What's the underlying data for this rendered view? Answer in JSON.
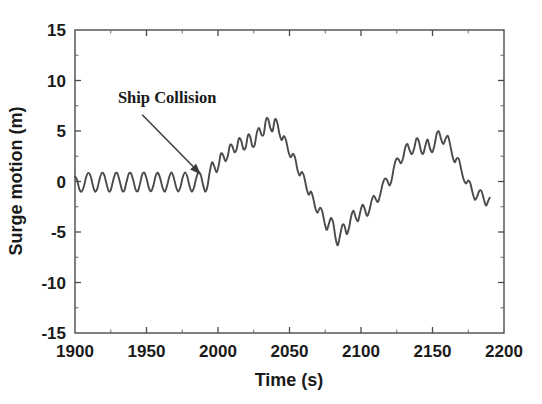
{
  "chart_data": {
    "type": "line",
    "title": "",
    "xlabel": "Time (s)",
    "ylabel": "Surge motion (m)",
    "xlim": [
      1900,
      2200
    ],
    "ylim": [
      -15,
      15
    ],
    "xticks": [
      1900,
      1950,
      2000,
      2050,
      2100,
      2150,
      2200
    ],
    "xtick_labels": [
      "1900",
      "1950",
      "2000",
      "2050",
      "2100",
      "2150",
      "2200"
    ],
    "yticks": [
      -15,
      -10,
      -5,
      0,
      5,
      10,
      15
    ],
    "ytick_labels": [
      "-15",
      "-10",
      "-5",
      "0",
      "5",
      "10",
      "15"
    ],
    "xminor_step": 25,
    "yminor_step": 2.5,
    "grid": false,
    "legend": null,
    "line_color": "#4b4b4b",
    "annotations": [
      {
        "text": "Ship Collision",
        "text_x": 1930,
        "text_y": 7.8,
        "arrow_from_x": 1947,
        "arrow_from_y": 6.6,
        "arrow_to_x": 1988,
        "arrow_to_y": 0.7
      }
    ],
    "series": [
      {
        "name": "Surge motion",
        "x": [
          1900,
          1901.5,
          1903,
          1904.6,
          1906.2,
          1907.8,
          1909.4,
          1911,
          1912.5,
          1914,
          1915.6,
          1917.2,
          1918.8,
          1920.4,
          1922,
          1923.5,
          1925,
          1926.6,
          1928.2,
          1929.8,
          1931.4,
          1933,
          1934.5,
          1936,
          1937.6,
          1939.2,
          1940.8,
          1942.4,
          1944,
          1945.5,
          1947,
          1948.6,
          1950.2,
          1951.8,
          1953.4,
          1955,
          1956.5,
          1958,
          1959.6,
          1961.2,
          1962.8,
          1964.4,
          1966,
          1967.5,
          1969,
          1970.6,
          1972.2,
          1973.8,
          1975.4,
          1977,
          1978.5,
          1980,
          1981.6,
          1983.2,
          1984.8,
          1986.4,
          1988,
          1989.5,
          1991,
          1992.6,
          1994.2,
          1995.8,
          1997.4,
          1999,
          2000.5,
          2002,
          2003.6,
          2005.2,
          2006.8,
          2008.4,
          2010,
          2011.5,
          2013,
          2014.6,
          2016.2,
          2017.8,
          2019.4,
          2021,
          2022.5,
          2024,
          2025.6,
          2027.2,
          2028.8,
          2030.4,
          2032,
          2033.5,
          2035,
          2036.6,
          2038.2,
          2039.8,
          2041.4,
          2043,
          2044.5,
          2046,
          2047.6,
          2049.2,
          2050.8,
          2052.4,
          2054,
          2055.5,
          2057,
          2058.6,
          2060.2,
          2061.8,
          2063.4,
          2065,
          2066.5,
          2068,
          2069.6,
          2071.2,
          2072.8,
          2074.4,
          2076,
          2077.5,
          2079,
          2080.6,
          2082.2,
          2083.8,
          2085.4,
          2087,
          2088.5,
          2090,
          2091.6,
          2093.2,
          2094.8,
          2096.4,
          2098,
          2099.5,
          2101,
          2102.6,
          2104.2,
          2105.8,
          2107.4,
          2109,
          2110.5,
          2112,
          2113.6,
          2115.2,
          2116.8,
          2118.4,
          2120,
          2121.5,
          2123,
          2124.6,
          2126.2,
          2127.8,
          2129.4,
          2131,
          2132.5,
          2134,
          2135.6,
          2137.2,
          2138.8,
          2140.4,
          2142,
          2143.5,
          2145,
          2146.6,
          2148.2,
          2149.8,
          2151.4,
          2153,
          2154.5,
          2156,
          2157.6,
          2159.2,
          2160.8,
          2162.4,
          2164,
          2165.5,
          2167,
          2168.6,
          2170.2,
          2171.8,
          2173.4,
          2175,
          2176.5,
          2178,
          2179.6,
          2181.2,
          2182.8,
          2184.4,
          2186,
          2187.5,
          2189,
          2190
        ],
        "values": [
          0.5,
          0.15,
          -0.75,
          -1.0,
          -0.5,
          0.45,
          0.85,
          0.5,
          -0.4,
          -1.0,
          -0.7,
          0.25,
          0.85,
          0.65,
          -0.2,
          -0.95,
          -0.85,
          0.05,
          0.8,
          0.75,
          -0.05,
          -0.9,
          -0.9,
          -0.05,
          0.75,
          0.8,
          0.1,
          -0.8,
          -0.95,
          -0.2,
          0.7,
          0.85,
          0.2,
          -0.7,
          -0.95,
          -0.3,
          0.6,
          0.85,
          0.3,
          -0.6,
          -1.0,
          -0.4,
          0.5,
          0.9,
          0.4,
          -0.5,
          -1.0,
          -0.5,
          0.45,
          0.9,
          0.5,
          -0.4,
          -1.0,
          -0.6,
          0.35,
          0.9,
          0.6,
          -0.3,
          -1.0,
          -0.5,
          0.95,
          1.9,
          1.5,
          0.9,
          1.6,
          2.75,
          2.6,
          2.0,
          2.5,
          3.6,
          3.5,
          2.9,
          3.2,
          4.25,
          4.05,
          3.2,
          3.4,
          4.6,
          4.45,
          3.5,
          3.6,
          4.85,
          5.3,
          4.6,
          4.7,
          6.1,
          6.2,
          5.3,
          5.0,
          6.15,
          5.85,
          4.7,
          4.1,
          4.5,
          4.05,
          3.0,
          2.4,
          2.75,
          2.3,
          1.2,
          0.6,
          0.95,
          0.5,
          -0.6,
          -1.3,
          -1.0,
          -1.6,
          -2.6,
          -3.1,
          -2.6,
          -2.9,
          -4.0,
          -4.8,
          -4.2,
          -3.6,
          -4.1,
          -5.6,
          -6.3,
          -5.3,
          -4.3,
          -4.4,
          -5.2,
          -4.6,
          -3.4,
          -2.9,
          -3.6,
          -3.9,
          -3.0,
          -2.3,
          -2.7,
          -3.4,
          -2.9,
          -1.9,
          -1.4,
          -1.8,
          -2.0,
          -1.2,
          -0.2,
          0.3,
          0.1,
          -0.4,
          0.2,
          1.4,
          2.2,
          2.2,
          1.8,
          2.3,
          3.4,
          3.7,
          3.1,
          2.7,
          3.3,
          4.25,
          4.0,
          3.0,
          2.75,
          3.55,
          4.15,
          3.3,
          2.9,
          3.6,
          4.75,
          4.95,
          4.2,
          3.7,
          4.25,
          4.5,
          3.6,
          2.5,
          1.9,
          2.3,
          2.15,
          1.1,
          0.2,
          -0.2,
          0.1,
          -0.2,
          -1.1,
          -1.8,
          -1.5,
          -0.9,
          -1.0,
          -1.8,
          -2.4,
          -1.9,
          -1.6
        ]
      }
    ]
  },
  "axis": {
    "x_title": "Time (s)",
    "y_title": "Surge motion (m)"
  }
}
